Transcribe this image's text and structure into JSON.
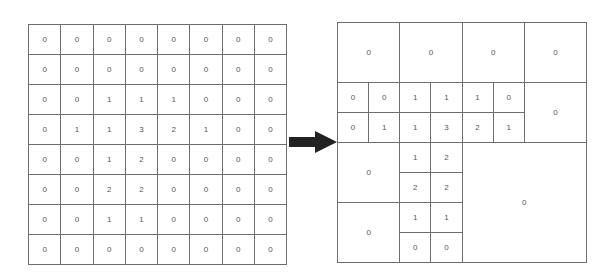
{
  "left_grid": {
    "rows": 8,
    "cols": 8,
    "values": [
      [
        "0",
        "0",
        "0",
        "0",
        "0",
        "0",
        "0",
        "0"
      ],
      [
        "0",
        "0",
        "0",
        "0",
        "0",
        "0",
        "0",
        "0"
      ],
      [
        "0",
        "0",
        "1",
        "1",
        "1",
        "0",
        "0",
        "0"
      ],
      [
        "0",
        "1",
        "1",
        "3",
        "2",
        "1",
        "0",
        "0"
      ],
      [
        "0",
        "0",
        "1",
        "2",
        "0",
        "0",
        "0",
        "0"
      ],
      [
        "0",
        "0",
        "2",
        "2",
        "0",
        "0",
        "0",
        "0"
      ],
      [
        "0",
        "0",
        "1",
        "1",
        "0",
        "0",
        "0",
        "0"
      ],
      [
        "0",
        "0",
        "0",
        "0",
        "0",
        "0",
        "0",
        "0"
      ]
    ]
  },
  "arrow": {
    "icon": "right-arrow-icon",
    "color": "#222222"
  },
  "right_grid": {
    "cells": [
      {
        "x": 0,
        "y": 0,
        "w": 2,
        "h": 2,
        "value": "0"
      },
      {
        "x": 2,
        "y": 0,
        "w": 2,
        "h": 2,
        "value": "0"
      },
      {
        "x": 4,
        "y": 0,
        "w": 2,
        "h": 2,
        "value": "0"
      },
      {
        "x": 6,
        "y": 0,
        "w": 2,
        "h": 2,
        "value": "0"
      },
      {
        "x": 0,
        "y": 2,
        "w": 1,
        "h": 1,
        "value": "0"
      },
      {
        "x": 1,
        "y": 2,
        "w": 1,
        "h": 1,
        "value": "0"
      },
      {
        "x": 2,
        "y": 2,
        "w": 1,
        "h": 1,
        "value": "1"
      },
      {
        "x": 3,
        "y": 2,
        "w": 1,
        "h": 1,
        "value": "1"
      },
      {
        "x": 4,
        "y": 2,
        "w": 1,
        "h": 1,
        "value": "1"
      },
      {
        "x": 5,
        "y": 2,
        "w": 1,
        "h": 1,
        "value": "0"
      },
      {
        "x": 6,
        "y": 2,
        "w": 2,
        "h": 2,
        "value": "0"
      },
      {
        "x": 0,
        "y": 3,
        "w": 1,
        "h": 1,
        "value": "0"
      },
      {
        "x": 1,
        "y": 3,
        "w": 1,
        "h": 1,
        "value": "1"
      },
      {
        "x": 2,
        "y": 3,
        "w": 1,
        "h": 1,
        "value": "1"
      },
      {
        "x": 3,
        "y": 3,
        "w": 1,
        "h": 1,
        "value": "3"
      },
      {
        "x": 4,
        "y": 3,
        "w": 1,
        "h": 1,
        "value": "2"
      },
      {
        "x": 5,
        "y": 3,
        "w": 1,
        "h": 1,
        "value": "1"
      },
      {
        "x": 0,
        "y": 4,
        "w": 2,
        "h": 2,
        "value": "0"
      },
      {
        "x": 2,
        "y": 4,
        "w": 1,
        "h": 1,
        "value": "1"
      },
      {
        "x": 3,
        "y": 4,
        "w": 1,
        "h": 1,
        "value": "2"
      },
      {
        "x": 2,
        "y": 5,
        "w": 1,
        "h": 1,
        "value": "2"
      },
      {
        "x": 3,
        "y": 5,
        "w": 1,
        "h": 1,
        "value": "2"
      },
      {
        "x": 4,
        "y": 4,
        "w": 4,
        "h": 4,
        "value": "0"
      },
      {
        "x": 0,
        "y": 6,
        "w": 2,
        "h": 2,
        "value": "0"
      },
      {
        "x": 2,
        "y": 6,
        "w": 1,
        "h": 1,
        "value": "1"
      },
      {
        "x": 3,
        "y": 6,
        "w": 1,
        "h": 1,
        "value": "1"
      },
      {
        "x": 2,
        "y": 7,
        "w": 1,
        "h": 1,
        "value": "0"
      },
      {
        "x": 3,
        "y": 7,
        "w": 1,
        "h": 1,
        "value": "0"
      }
    ]
  }
}
